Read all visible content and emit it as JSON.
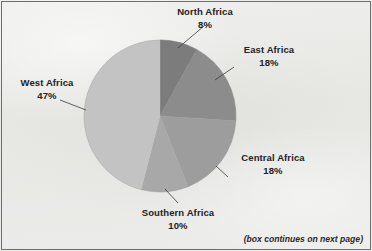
{
  "figure": {
    "background_color": "#e9e9e7",
    "border_color": "#6f6f6d",
    "footnote": "(box continues on next page)"
  },
  "chart_data": {
    "type": "pie",
    "title": "",
    "subtitle": "",
    "xlabel": "",
    "ylabel": "",
    "legend_position": "none",
    "grid": false,
    "units": "percent",
    "start_angle_deg": 0,
    "direction": "clockwise",
    "center": {
      "x": 160,
      "y": 116
    },
    "radius": 76,
    "categories": [
      "North Africa",
      "East Africa",
      "Central Africa",
      "Southern Africa",
      "West Africa"
    ],
    "values": [
      8,
      18,
      18,
      10,
      47
    ],
    "value_labels": [
      "8%",
      "18%",
      "18%",
      "10%",
      "47%"
    ],
    "slices": [
      {
        "label": "North Africa",
        "value": 8,
        "value_label": "8%",
        "color": "#7c7c7c",
        "start_deg": 0,
        "end_deg": 28.8,
        "label_position": "top"
      },
      {
        "label": "East Africa",
        "value": 18,
        "value_label": "18%",
        "color": "#8c8c8c",
        "start_deg": 28.8,
        "end_deg": 93.6,
        "label_position": "top-right"
      },
      {
        "label": "Central Africa",
        "value": 18,
        "value_label": "18%",
        "color": "#9d9d9d",
        "start_deg": 93.6,
        "end_deg": 158.4,
        "label_position": "bottom-right"
      },
      {
        "label": "Southern Africa",
        "value": 10,
        "value_label": "10%",
        "color": "#a8a8a8",
        "start_deg": 158.4,
        "end_deg": 194.4,
        "label_position": "bottom"
      },
      {
        "label": "West Africa",
        "value": 47,
        "value_label": "47%",
        "color": "#c3c3c3",
        "start_deg": 194.4,
        "end_deg": 360,
        "label_position": "left"
      }
    ],
    "leader_lines": [
      {
        "for": "North Africa",
        "from": {
          "x": 204,
          "y": 26
        },
        "to": {
          "x": 178,
          "y": 48
        }
      },
      {
        "for": "East Africa",
        "from": {
          "x": 234,
          "y": 67
        },
        "to": {
          "x": 215,
          "y": 80
        }
      },
      {
        "for": "Central Africa",
        "from": {
          "x": 228,
          "y": 177
        },
        "to": {
          "x": 216,
          "y": 166
        }
      },
      {
        "for": "Southern Africa",
        "from": {
          "x": 178,
          "y": 203
        },
        "to": {
          "x": 165,
          "y": 189
        }
      },
      {
        "for": "West Africa",
        "from": {
          "x": 60,
          "y": 100
        },
        "to": {
          "x": 86,
          "y": 110
        }
      }
    ]
  }
}
